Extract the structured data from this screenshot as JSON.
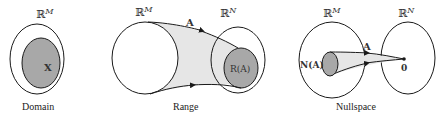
{
  "colors": {
    "stroke": "#1a1a1a",
    "subset_fill": "#a8a8a8",
    "cone_fill": "#e6e6e6",
    "background": "#ffffff"
  },
  "panels": [
    {
      "id": "domain",
      "caption": "Domain",
      "space_label": {
        "base": "ℝ",
        "sup": "M"
      },
      "subset_label": "X"
    },
    {
      "id": "range",
      "caption": "Range",
      "source_label": {
        "base": "ℝ",
        "sup": "M"
      },
      "target_label": {
        "base": "ℝ",
        "sup": "N"
      },
      "map_label": "A",
      "subset_label": "R(A)"
    },
    {
      "id": "nullspace",
      "caption": "Nullspace",
      "source_label": {
        "base": "ℝ",
        "sup": "M"
      },
      "target_label": {
        "base": "ℝ",
        "sup": "N"
      },
      "map_label": "A",
      "subset_label": "N(A)",
      "point_label": "0"
    }
  ]
}
